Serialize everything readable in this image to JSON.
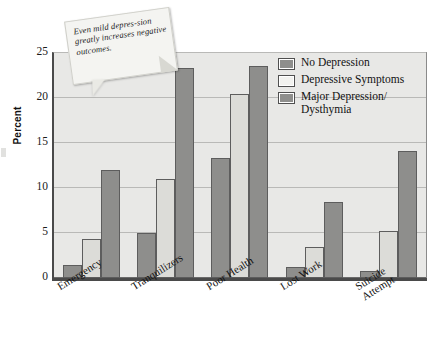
{
  "chart_data": {
    "type": "bar",
    "title": "",
    "xlabel": "",
    "ylabel": "Percent",
    "ylim": [
      0,
      25
    ],
    "yticks": [
      0,
      5,
      10,
      15,
      20,
      25
    ],
    "grid": true,
    "legend_position": "top-right",
    "categories": [
      "Emergency",
      "Tranquilizers",
      "Poor Health",
      "Lost Work",
      "Suicide Attempt"
    ],
    "series": [
      {
        "name": "No Depression",
        "color": "#8e8e8c",
        "values": [
          1.5,
          5.0,
          13.3,
          1.2,
          0.8
        ]
      },
      {
        "name": "Depressive Symptoms",
        "color": "#dcdcd8",
        "values": [
          4.3,
          11.0,
          20.4,
          3.4,
          5.2
        ]
      },
      {
        "name": "Major Depression/Dysthymia",
        "color": "#8e8e8c",
        "values": [
          12.0,
          23.3,
          23.6,
          8.5,
          14.1
        ]
      }
    ],
    "annotation": "Even mild depression greatly increases negative outcomes."
  },
  "axis": {
    "y_title": "Percent",
    "y_ticks": [
      "25",
      "20",
      "15",
      "10",
      "5",
      "0"
    ],
    "x_categories": [
      {
        "line1": "Emergency",
        "line2": ""
      },
      {
        "line1": "Tranquilizers",
        "line2": ""
      },
      {
        "line1": "Poor Health",
        "line2": ""
      },
      {
        "line1": "Lost Work",
        "line2": ""
      },
      {
        "line1": "Suicide",
        "line2": "Attempt"
      }
    ]
  },
  "legend": {
    "entries": [
      {
        "label_line1": "No Depression",
        "label_line2": ""
      },
      {
        "label_line1": "Depressive Symptoms",
        "label_line2": ""
      },
      {
        "label_line1": "Major Depression/",
        "label_line2": "Dysthymia"
      }
    ]
  },
  "note": {
    "text": "Even mild depres-sion greatly increases negative outcomes."
  },
  "colors": {
    "series_dark": "#8e8e8c",
    "series_light": "#dcdcd8",
    "plot_background": "#e8e8e6",
    "axis": "#4a4a4a",
    "gridline": "#b9b9b7"
  }
}
